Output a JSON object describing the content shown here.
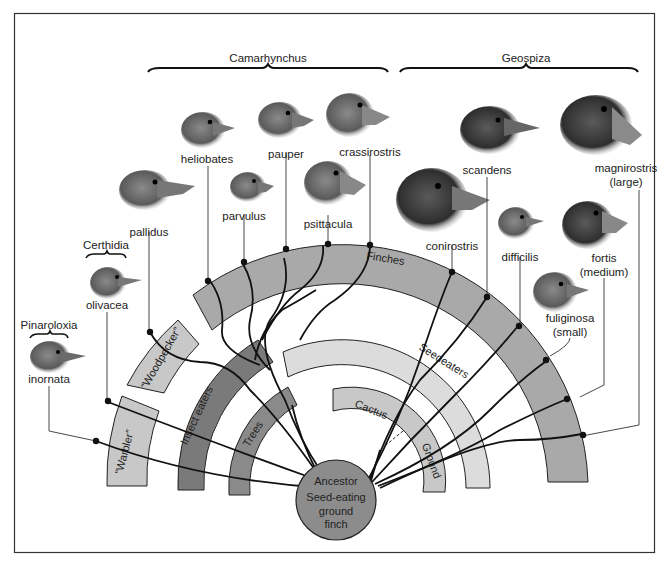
{
  "genera": [
    {
      "name": "Camarhynchus"
    },
    {
      "name": "Geospiza"
    },
    {
      "name": "Certhidia"
    },
    {
      "name": "Pinaroloxia"
    }
  ],
  "species": [
    {
      "name": "inornata",
      "genus": "Pinaroloxia"
    },
    {
      "name": "olivacea",
      "genus": "Certhidia"
    },
    {
      "name": "pallidus",
      "genus": "Camarhynchus"
    },
    {
      "name": "heliobates",
      "genus": "Camarhynchus"
    },
    {
      "name": "parvulus",
      "genus": "Camarhynchus"
    },
    {
      "name": "pauper",
      "genus": "Camarhynchus"
    },
    {
      "name": "psittacula",
      "genus": "Camarhynchus"
    },
    {
      "name": "crassirostris",
      "genus": "Camarhynchus"
    },
    {
      "name": "conirostris",
      "genus": "Geospiza"
    },
    {
      "name": "scandens",
      "genus": "Geospiza"
    },
    {
      "name": "difficilis",
      "genus": "Geospiza"
    },
    {
      "name": "fuliginosa",
      "note": "(small)",
      "genus": "Geospiza"
    },
    {
      "name": "fortis",
      "note": "(medium)",
      "genus": "Geospiza"
    },
    {
      "name": "magnirostris",
      "note": "(large)",
      "genus": "Geospiza"
    }
  ],
  "bands": {
    "warbler": "“Warbler”",
    "woodpecker": "“Woodpecker”",
    "insect_eaters": "Insect eaters",
    "trees": "Trees",
    "finches": "Finches",
    "seedeaters": "Seedeaters",
    "cactus": "Cactus",
    "ground": "Ground"
  },
  "ancestor": {
    "line1": "Ancestor",
    "line2": "Seed-eating",
    "line3": "ground",
    "line4": "finch"
  },
  "colors": {
    "light_band": "#c8c8c8",
    "mid_band": "#a9a9a9",
    "dark_band": "#7a7a7a",
    "pale_band": "#dcdcdc",
    "ancestor": "#8c8c8c"
  }
}
